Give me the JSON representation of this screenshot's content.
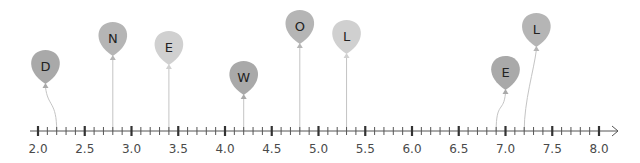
{
  "number_line": {
    "min": 2.0,
    "max": 8.0,
    "major_step": 0.5,
    "minor_step": 0.1,
    "major_labels": [
      "2.0",
      "2.5",
      "3.0",
      "3.5",
      "4.0",
      "4.5",
      "5.0",
      "5.5",
      "6.0",
      "6.5",
      "7.0",
      "7.5",
      "8.0"
    ],
    "arrow": "right"
  },
  "balloons": [
    {
      "letter": "D",
      "value": 2.2,
      "color": "#a9a9a9",
      "balloon_x": 2.08,
      "balloon_y": 66,
      "curved": true
    },
    {
      "letter": "N",
      "value": 2.8,
      "color": "#b5b5b5",
      "balloon_x": 2.8,
      "balloon_y": 38,
      "curved": false
    },
    {
      "letter": "E",
      "value": 3.4,
      "color": "#d0d0d0",
      "balloon_x": 3.4,
      "balloon_y": 47,
      "curved": false
    },
    {
      "letter": "W",
      "value": 4.2,
      "color": "#a9a9a9",
      "balloon_x": 4.2,
      "balloon_y": 77,
      "curved": false
    },
    {
      "letter": "O",
      "value": 4.8,
      "color": "#b5b5b5",
      "balloon_x": 4.8,
      "balloon_y": 26,
      "curved": false
    },
    {
      "letter": "L",
      "value": 5.3,
      "color": "#d0d0d0",
      "balloon_x": 5.3,
      "balloon_y": 36,
      "curved": false
    },
    {
      "letter": "E",
      "value": 6.9,
      "color": "#a9a9a9",
      "balloon_x": 7.0,
      "balloon_y": 72,
      "curved": true
    },
    {
      "letter": "L",
      "value": 7.2,
      "color": "#b5b5b5",
      "balloon_x": 7.33,
      "balloon_y": 29,
      "curved": true
    }
  ],
  "hidden_word": "DNEWOLEL"
}
